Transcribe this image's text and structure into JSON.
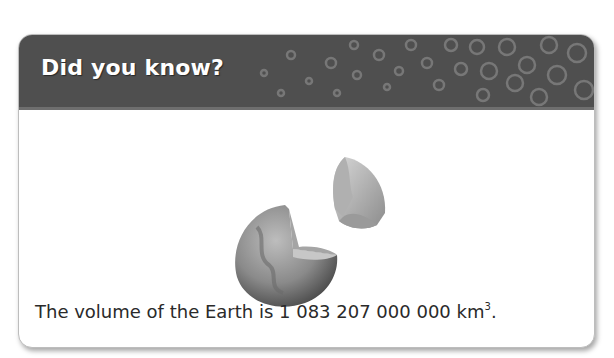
{
  "card": {
    "title": "Did you know?",
    "header_color": "#4f4f4f",
    "pattern_color": "#7a7a7a",
    "illustration": {
      "icon": "earth-cutaway-icon",
      "description": "Cutaway of the Earth showing its internal layers"
    },
    "fact": {
      "prefix": "The volume of the Earth is ",
      "value": "1 083 207 000 000",
      "unit": "km",
      "exponent": "3",
      "suffix": "."
    }
  }
}
